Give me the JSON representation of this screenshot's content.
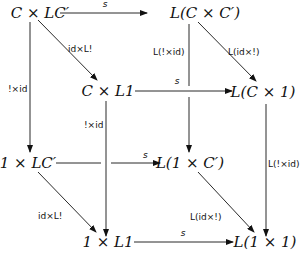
{
  "nodes": {
    "CxLC": {
      "label": "C × LC′",
      "x": 40,
      "y": 18
    },
    "LCxC": {
      "label": "L(C × C′)",
      "x": 208,
      "y": 18
    },
    "CxL1": {
      "label": "C × L1",
      "x": 110,
      "y": 95
    },
    "LCx1": {
      "label": "L(C × 1)",
      "x": 262,
      "y": 97
    },
    "1xLC": {
      "label": "1 × LC′",
      "x": 28,
      "y": 167
    },
    "L1xC": {
      "label": "L(1 × C′)",
      "x": 192,
      "y": 167
    },
    "1xL1": {
      "label": "1 × L1",
      "x": 110,
      "y": 247
    },
    "L1x1": {
      "label": "L(1 × 1)",
      "x": 265,
      "y": 247
    }
  },
  "edges": {
    "top_s": {
      "label": "s"
    },
    "CxLC_CxL1": {
      "label": "id×L!"
    },
    "CxLC_1xLC": {
      "label": "!×id"
    },
    "LCxC_LCx1": {
      "label": "L(id×!)"
    },
    "LCxC_L1xC": {
      "label": "L(!×id)"
    },
    "CxL1_LCx1": {
      "label": "s"
    },
    "CxL1_1xL1": {
      "label": "!×id"
    },
    "LCx1_L1x1": {
      "label": "L(!×id)"
    },
    "1xLC_L1xC": {
      "label": "s"
    },
    "1xLC_1xL1": {
      "label": "id×L!"
    },
    "L1xC_L1x1": {
      "label": "L(id×!)"
    },
    "1xL1_L1x1": {
      "label": "s"
    }
  }
}
